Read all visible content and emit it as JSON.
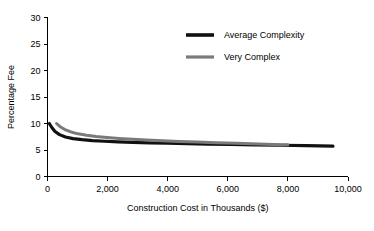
{
  "chart_data": {
    "type": "line",
    "title": "",
    "xlabel": "Construction Cost in Thousands ($)",
    "ylabel": "Percentage Fee",
    "xlim": [
      0,
      10000
    ],
    "ylim": [
      0,
      30
    ],
    "grid": false,
    "legend_position": "top-center",
    "xticks": [
      0,
      2000,
      4000,
      6000,
      8000,
      10000
    ],
    "xtick_labels": [
      "0",
      "2,000",
      "4,000",
      "6,000",
      "8,000",
      "10,000"
    ],
    "yticks": [
      0,
      5,
      10,
      15,
      20,
      25,
      30
    ],
    "ytick_labels": [
      "0",
      "5",
      "10",
      "15",
      "20",
      "25",
      "30"
    ],
    "series": [
      {
        "name": "Average Complexity",
        "color": "#111111",
        "width": 3.2,
        "x": [
          60,
          150,
          250,
          400,
          600,
          850,
          1150,
          1500,
          1900,
          2350,
          2850,
          3400,
          4000,
          4650,
          5350,
          6100,
          6900,
          7750,
          8600,
          9500
        ],
        "values": [
          10.0,
          9.2,
          8.5,
          7.9,
          7.45,
          7.15,
          6.95,
          6.78,
          6.65,
          6.54,
          6.44,
          6.35,
          6.27,
          6.2,
          6.12,
          6.05,
          5.97,
          5.9,
          5.82,
          5.72
        ]
      },
      {
        "name": "Very Complex",
        "color": "#7a7a7a",
        "width": 3.0,
        "x": [
          300,
          420,
          580,
          780,
          1020,
          1300,
          1620,
          1980,
          2380,
          2820,
          3300,
          3820,
          4380,
          4980,
          5620,
          6300,
          7020,
          7780,
          8000
        ],
        "values": [
          10.0,
          9.4,
          8.85,
          8.4,
          8.05,
          7.78,
          7.55,
          7.35,
          7.17,
          7.01,
          6.87,
          6.74,
          6.62,
          6.5,
          6.38,
          6.26,
          6.13,
          6.0,
          5.97
        ]
      }
    ],
    "legend": [
      {
        "label": "Average Complexity",
        "color": "#111111",
        "width": 3.6
      },
      {
        "label": "Very Complex",
        "color": "#7a7a7a",
        "width": 3.2
      }
    ]
  }
}
